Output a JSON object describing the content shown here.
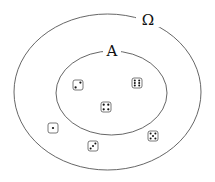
{
  "diagram": {
    "type": "venn",
    "universe": {
      "label": "Ω",
      "cx": 107.5,
      "cy": 92,
      "rx": 93.5,
      "ry": 78
    },
    "subset": {
      "label": "A",
      "cx": 111.5,
      "cy": 93,
      "rx": 55.5,
      "ry": 42
    },
    "elements_in_A": [
      {
        "face": 2,
        "x": 78,
        "y": 85
      },
      {
        "face": 6,
        "x": 137,
        "y": 83
      },
      {
        "face": 4,
        "x": 106,
        "y": 107
      }
    ],
    "elements_outside_A": [
      {
        "face": 1,
        "x": 53,
        "y": 128
      },
      {
        "face": 3,
        "x": 93,
        "y": 146
      },
      {
        "face": 5,
        "x": 153,
        "y": 136
      }
    ],
    "colors": {
      "stroke": "#555555",
      "pip": "#111111",
      "background": "#ffffff"
    }
  }
}
